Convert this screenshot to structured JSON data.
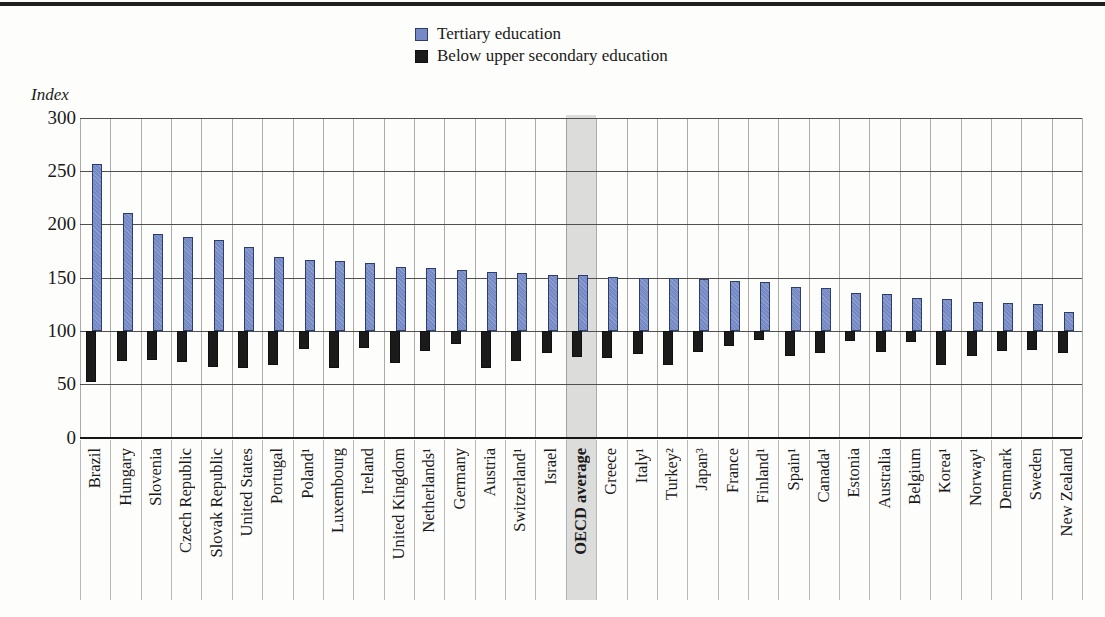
{
  "page": {
    "background_color": "#fdfdfb",
    "top_rule_color": "#1f1f1f"
  },
  "legend": {
    "items": [
      {
        "label": "Tertiary education",
        "color": "#7589c4",
        "border": "#2d3d6e"
      },
      {
        "label": "Below upper secondary education",
        "color": "#1b1b1b",
        "border": "#101010"
      }
    ]
  },
  "axis": {
    "unit_label": "Index",
    "ticks": [
      300,
      250,
      200,
      150,
      100,
      50,
      0
    ]
  },
  "chart_data": {
    "type": "bar",
    "title": "",
    "xlabel": "",
    "ylabel": "Index",
    "ylim": [
      0,
      300
    ],
    "baseline": 100,
    "grid": true,
    "legend_position": "top",
    "highlight_category": "OECD average",
    "highlight_band_color": "#dcdcda",
    "categories": [
      "Brazil",
      "Hungary",
      "Slovenia",
      "Czech Republic",
      "Slovak Republic",
      "United States",
      "Portugal",
      "Poland¹",
      "Luxembourg",
      "Ireland",
      "United Kingdom",
      "Netherlands¹",
      "Germany",
      "Austria",
      "Switzerland¹",
      "Israel",
      "OECD average",
      "Greece",
      "Italy¹",
      "Turkey²",
      "Japan³",
      "France",
      "Finland¹",
      "Spain¹",
      "Canada¹",
      "Estonia",
      "Australia",
      "Belgium",
      "Korea¹",
      "Norway¹",
      "Denmark",
      "Sweden",
      "New Zealand"
    ],
    "series": [
      {
        "name": "Tertiary education",
        "color": "#7589c4",
        "values": [
          257,
          211,
          191,
          188,
          185,
          179,
          169,
          167,
          166,
          164,
          160,
          159,
          157,
          155,
          154,
          153,
          153,
          151,
          150,
          150,
          149,
          147,
          146,
          141,
          140,
          136,
          135,
          131,
          130,
          127,
          126,
          125,
          118
        ]
      },
      {
        "name": "Below upper secondary education",
        "color": "#1b1b1b",
        "values": [
          52,
          72,
          73,
          71,
          66,
          65,
          68,
          83,
          65,
          84,
          70,
          81,
          88,
          65,
          72,
          79,
          76,
          75,
          78,
          68,
          80,
          86,
          92,
          77,
          79,
          91,
          80,
          90,
          68,
          77,
          81,
          82,
          79
        ]
      }
    ]
  }
}
